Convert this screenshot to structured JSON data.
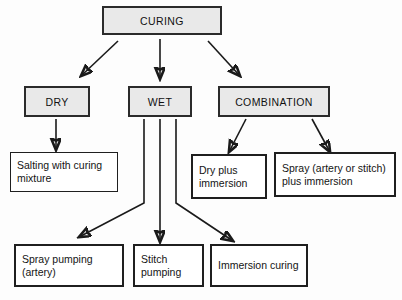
{
  "diagram": {
    "colors": {
      "shaded_fill": "#e9e9e9",
      "plain_fill": "#ffffff",
      "border": "#2b2b2b",
      "arrow": "#1a1a1a",
      "background": "#fdfdfd"
    },
    "nodes": {
      "root": "CURING",
      "dry": "DRY",
      "wet": "WET",
      "combination": "COMBINATION",
      "salting": "Salting with curing mixture",
      "dry_plus_immersion": "Dry plus immersion",
      "spray_plus_immersion": "Spray (artery or stitch) plus immersion",
      "spray_pumping": "Spray pumping (artery)",
      "stitch_pumping": "Stitch pumping",
      "immersion_curing": "Immersion curing"
    },
    "edges": [
      {
        "from": "CURING",
        "to": "DRY"
      },
      {
        "from": "CURING",
        "to": "WET"
      },
      {
        "from": "CURING",
        "to": "COMBINATION"
      },
      {
        "from": "DRY",
        "to": "Salting with curing mixture"
      },
      {
        "from": "WET",
        "to": "Spray pumping (artery)"
      },
      {
        "from": "WET",
        "to": "Stitch pumping"
      },
      {
        "from": "WET",
        "to": "Immersion curing"
      },
      {
        "from": "COMBINATION",
        "to": "Dry plus immersion"
      },
      {
        "from": "COMBINATION",
        "to": "Spray (artery or stitch) plus immersion"
      }
    ]
  }
}
